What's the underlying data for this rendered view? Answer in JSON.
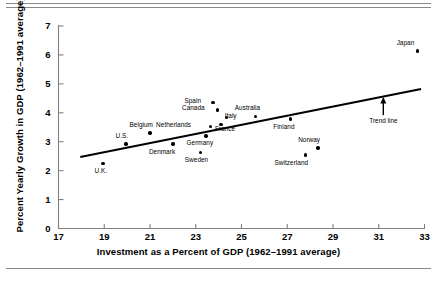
{
  "chart_data": {
    "type": "scatter",
    "title": "",
    "xlabel": "Investment as a Percent of GDP (1962–1991 average)",
    "ylabel": "Percent Yearly Growth in GDP (1962–1991 average)",
    "xlim": [
      17,
      33
    ],
    "ylim": [
      0,
      7
    ],
    "xticks": [
      17,
      19,
      21,
      23,
      25,
      27,
      29,
      31,
      33
    ],
    "yticks": [
      0,
      1,
      2,
      3,
      4,
      5,
      6,
      7
    ],
    "grid": false,
    "legend": "none",
    "points": [
      {
        "label": "U.K.",
        "x": 18.95,
        "y": 2.25,
        "label_dx": -2,
        "label_dy": 7
      },
      {
        "label": "U.S.",
        "x": 19.95,
        "y": 2.92,
        "label_dx": -4,
        "label_dy": -9
      },
      {
        "label": "Belgium",
        "x": 21.0,
        "y": 3.3,
        "label_dx": -9,
        "label_dy": -9
      },
      {
        "label": "Denmark",
        "x": 22.0,
        "y": 2.92,
        "label_dx": -11,
        "label_dy": 7
      },
      {
        "label": "Sweden",
        "x": 23.2,
        "y": 2.63,
        "label_dx": -4,
        "label_dy": 7
      },
      {
        "label": "Germany",
        "x": 23.45,
        "y": 3.2,
        "label_dx": -6,
        "label_dy": 7
      },
      {
        "label": "Netherlands",
        "x": 23.65,
        "y": 3.52,
        "label_dx": -37,
        "label_dy": -2
      },
      {
        "label": "Spain",
        "x": 23.75,
        "y": 4.36,
        "label_dx": -20,
        "label_dy": -2
      },
      {
        "label": "Canada",
        "x": 23.95,
        "y": 4.1,
        "label_dx": -24,
        "label_dy": -2
      },
      {
        "label": "France",
        "x": 24.1,
        "y": 3.6,
        "label_dx": 4,
        "label_dy": 4
      },
      {
        "label": "Italy",
        "x": 24.35,
        "y": 3.84,
        "label_dx": 4,
        "label_dy": -2
      },
      {
        "label": "Australia",
        "x": 25.6,
        "y": 3.88,
        "label_dx": -8,
        "label_dy": -9
      },
      {
        "label": "Finland",
        "x": 27.15,
        "y": 3.78,
        "label_dx": -7,
        "label_dy": 7
      },
      {
        "label": "Switzerland",
        "x": 27.8,
        "y": 2.54,
        "label_dx": -14,
        "label_dy": 7
      },
      {
        "label": "Norway",
        "x": 28.35,
        "y": 2.78,
        "label_dx": -9,
        "label_dy": -9
      },
      {
        "label": "Japan",
        "x": 32.7,
        "y": 6.13,
        "label_dx": -12,
        "label_dy": -9
      }
    ],
    "trend_line": {
      "label": "Trend line",
      "x_start": 17.95,
      "y_start": 2.47,
      "x_end": 32.85,
      "y_end": 4.82,
      "annotation_x": 31.2,
      "annotation_y": 3.92
    }
  }
}
